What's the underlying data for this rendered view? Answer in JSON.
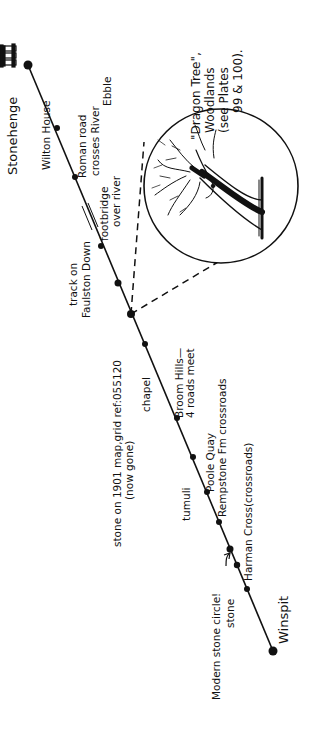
{
  "diagram": {
    "type": "route-map",
    "orientation": "rotated -90deg (text reads bottom-to-top)",
    "colors": {
      "ink": "#111111",
      "background": "#ffffff"
    },
    "route": {
      "start": "Stonehenge",
      "end": "Winspit",
      "start_point": [
        28,
        65
      ],
      "end_point": [
        273,
        651
      ]
    },
    "stops": [
      {
        "id": "stonehenge",
        "point": [
          28,
          65
        ]
      },
      {
        "id": "wilton-house",
        "point": [
          57,
          128
        ]
      },
      {
        "id": "roman-road",
        "point": [
          75,
          177
        ]
      },
      {
        "id": "footbridge",
        "point": [
          100,
          247
        ]
      },
      {
        "id": "track-faulston",
        "point": [
          118,
          283
        ]
      },
      {
        "id": "grid-stone",
        "point": [
          131,
          314
        ]
      },
      {
        "id": "chapel",
        "point": [
          145,
          344
        ]
      },
      {
        "id": "broom-hills",
        "point": [
          177,
          418
        ]
      },
      {
        "id": "tumuli",
        "point": [
          193,
          457
        ]
      },
      {
        "id": "poole-quay",
        "point": [
          207,
          490
        ]
      },
      {
        "id": "rempstone",
        "point": [
          219,
          521
        ]
      },
      {
        "id": "modern-stone-circle",
        "point": [
          230,
          549
        ]
      },
      {
        "id": "harman-cross",
        "point": [
          237,
          564
        ]
      },
      {
        "id": "winspit-mid",
        "point": [
          247,
          589
        ]
      },
      {
        "id": "winspit",
        "point": [
          273,
          651
        ]
      }
    ],
    "labels": {
      "stonehenge": "Stonehenge",
      "wilton_house": "Wilton House",
      "roman_road_1": "Roman road",
      "roman_road_2": "crosses River",
      "roman_road_3": "Ebble",
      "footbridge_1": "footbridge",
      "footbridge_2": "over river",
      "track_1": "track on",
      "track_2": "Faulston Down",
      "grid_stone_1": "stone on 1901 map,grid ref:055120",
      "grid_stone_2": "(now gone)",
      "chapel": "chapel",
      "broom_1": "Broom Hills—",
      "broom_2": "4 roads meet",
      "tumuli": "tumuli",
      "poole_quay": "Poole Quay",
      "rempstone": "Rempstone Fm crossroads",
      "harman": "Harman Cross(crossroads)",
      "modern_circle": "Modern stone circle!",
      "stone": "stone",
      "winspit": "Winspit",
      "tree_1": "\"Dragon Tree\",",
      "tree_2": "Woodlands",
      "tree_3": "(see Plates",
      "tree_4": "99 & 100)."
    },
    "inset": {
      "subject": "Dragon Tree illustration",
      "center": [
        221,
        186
      ],
      "radius": 77
    }
  }
}
